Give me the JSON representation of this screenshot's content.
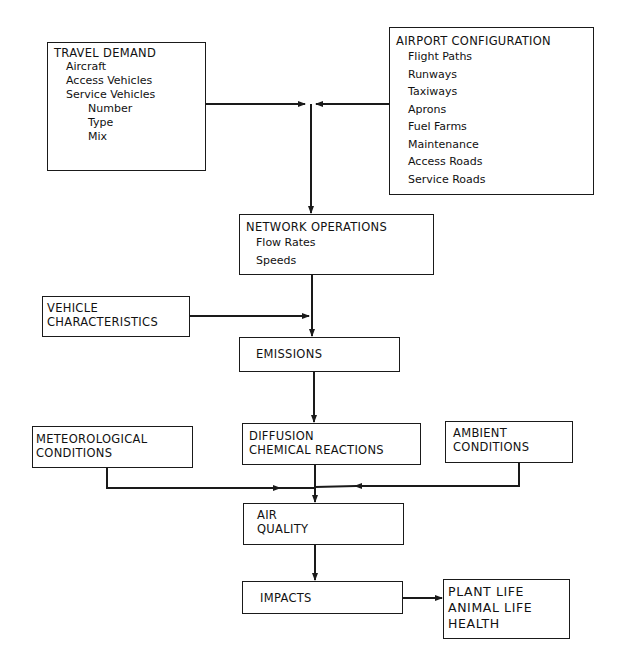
{
  "diagram": {
    "nodes": {
      "travel_demand": {
        "title": "TRAVEL DEMAND",
        "items": [
          "Aircraft",
          "Access Vehicles",
          "Service Vehicles"
        ],
        "subitems": [
          "Number",
          "Type",
          "Mix"
        ]
      },
      "airport_configuration": {
        "title": "AIRPORT CONFIGURATION",
        "items": [
          "Flight Paths",
          "Runways",
          "Taxiways",
          "Aprons",
          "Fuel Farms",
          "Maintenance",
          "Access Roads",
          "Service Roads"
        ]
      },
      "network_operations": {
        "title": "NETWORK OPERATIONS",
        "items": [
          "Flow Rates",
          "Speeds"
        ]
      },
      "vehicle_characteristics": {
        "lines": [
          "VEHICLE",
          "CHARACTERISTICS"
        ]
      },
      "emissions": {
        "title": "EMISSIONS"
      },
      "meteorological_conditions": {
        "lines": [
          "METEOROLOGICAL",
          "CONDITIONS"
        ]
      },
      "diffusion": {
        "lines": [
          "DIFFUSION",
          "CHEMICAL REACTIONS"
        ]
      },
      "ambient_conditions": {
        "lines": [
          "AMBIENT",
          "CONDITIONS"
        ]
      },
      "air_quality": {
        "lines": [
          "AIR",
          "QUALITY"
        ]
      },
      "impacts": {
        "title": "IMPACTS"
      },
      "outcomes": {
        "lines": [
          "PLANT LIFE",
          "ANIMAL LIFE",
          "HEALTH"
        ]
      }
    },
    "edges": [
      {
        "from": "travel_demand",
        "to": "network_operations"
      },
      {
        "from": "airport_configuration",
        "to": "network_operations"
      },
      {
        "from": "network_operations",
        "to": "emissions"
      },
      {
        "from": "vehicle_characteristics",
        "to": "emissions"
      },
      {
        "from": "emissions",
        "to": "diffusion"
      },
      {
        "from": "diffusion",
        "to": "air_quality"
      },
      {
        "from": "meteorological_conditions",
        "to": "air_quality"
      },
      {
        "from": "ambient_conditions",
        "to": "air_quality"
      },
      {
        "from": "air_quality",
        "to": "impacts"
      },
      {
        "from": "impacts",
        "to": "outcomes"
      }
    ]
  }
}
